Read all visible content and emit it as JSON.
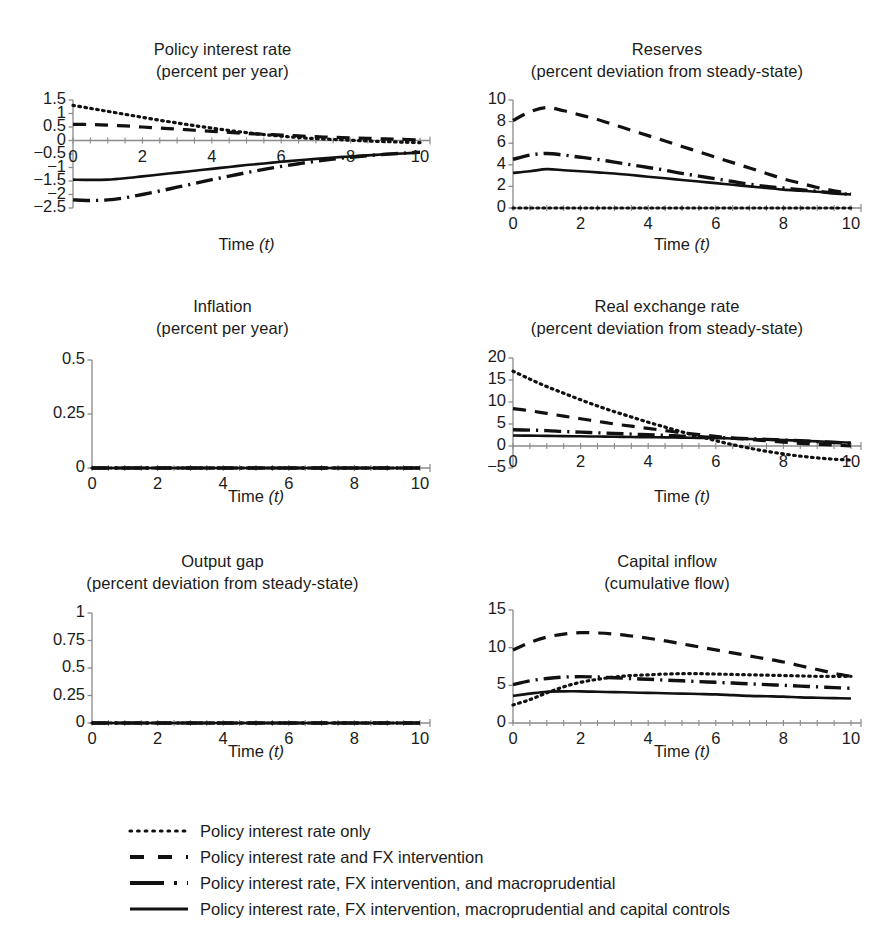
{
  "figure": {
    "axis_label": "Time (t)",
    "axis_label_main": "Time",
    "axis_label_var": "(t)"
  },
  "legend": {
    "position": "bottom",
    "items": [
      {
        "label": "Policy interest rate only",
        "style": "dotted",
        "name": "legend-item-dotted"
      },
      {
        "label": "Policy interest rate and FX intervention",
        "style": "dashed",
        "name": "legend-item-dashed"
      },
      {
        "label": "Policy interest rate, FX intervention, and macroprudential",
        "style": "dash-dot",
        "name": "legend-item-dashdot"
      },
      {
        "label": "Policy interest rate, FX intervention, macroprudential and capital controls",
        "style": "solid",
        "name": "legend-item-solid"
      }
    ]
  },
  "chart_data": [
    {
      "id": "policy-interest-rate",
      "type": "line",
      "title": "Policy interest rate",
      "subtitle": "(percent per year)",
      "xlabel": "Time (t)",
      "ylabel": "",
      "xlim": [
        0,
        10
      ],
      "ylim": [
        -2.5,
        1.5
      ],
      "xticks": [
        0,
        2,
        4,
        6,
        8,
        10
      ],
      "yticks": [
        1.5,
        1,
        0.5,
        0,
        -0.5,
        -1,
        -1.5,
        -2,
        -2.5
      ],
      "ytick_labels": [
        "1.5",
        "1",
        "0.5",
        "0",
        "−0.5",
        "−1",
        "−1.5",
        "−2",
        "−2.5"
      ],
      "grid": false,
      "x": [
        0,
        0.5,
        1,
        1.5,
        2,
        2.5,
        3,
        3.5,
        4,
        4.5,
        5,
        5.5,
        6,
        6.5,
        7,
        7.5,
        8,
        8.5,
        9,
        9.5,
        10
      ],
      "series": [
        {
          "name": "Policy interest rate only",
          "style": "dotted",
          "values": [
            1.3,
            1.19,
            1.08,
            0.97,
            0.86,
            0.75,
            0.65,
            0.55,
            0.46,
            0.37,
            0.29,
            0.22,
            0.16,
            0.11,
            0.07,
            0.04,
            0.01,
            -0.02,
            -0.04,
            -0.06,
            -0.08
          ]
        },
        {
          "name": "Policy interest rate and FX intervention",
          "style": "dashed",
          "values": [
            0.6,
            0.59,
            0.57,
            0.54,
            0.5,
            0.46,
            0.42,
            0.38,
            0.34,
            0.3,
            0.26,
            0.23,
            0.2,
            0.17,
            0.14,
            0.12,
            0.1,
            0.08,
            0.06,
            0.04,
            0.02
          ]
        },
        {
          "name": "Policy interest rate, FX intervention, and macroprudential",
          "style": "dash-dot",
          "values": [
            -2.2,
            -2.22,
            -2.2,
            -2.12,
            -2.0,
            -1.87,
            -1.73,
            -1.59,
            -1.45,
            -1.32,
            -1.19,
            -1.07,
            -0.96,
            -0.86,
            -0.77,
            -0.69,
            -0.62,
            -0.56,
            -0.51,
            -0.47,
            -0.43
          ]
        },
        {
          "name": "Policy interest rate, FX intervention, macroprudential and capital controls",
          "style": "solid",
          "values": [
            -1.45,
            -1.46,
            -1.45,
            -1.4,
            -1.33,
            -1.26,
            -1.19,
            -1.12,
            -1.05,
            -0.98,
            -0.91,
            -0.85,
            -0.79,
            -0.73,
            -0.68,
            -0.63,
            -0.59,
            -0.55,
            -0.51,
            -0.48,
            -0.45
          ]
        }
      ]
    },
    {
      "id": "reserves",
      "type": "line",
      "title": "Reserves",
      "subtitle": "(percent deviation from steady-state)",
      "xlabel": "Time (t)",
      "ylabel": "",
      "xlim": [
        0,
        10
      ],
      "ylim": [
        0,
        10
      ],
      "xticks": [
        0,
        2,
        4,
        6,
        8,
        10
      ],
      "yticks": [
        0,
        2,
        4,
        6,
        8,
        10
      ],
      "ytick_labels": [
        "0",
        "2",
        "4",
        "6",
        "8",
        "10"
      ],
      "grid": false,
      "x": [
        0,
        0.5,
        1,
        1.5,
        2,
        2.5,
        3,
        3.5,
        4,
        4.5,
        5,
        5.5,
        6,
        6.5,
        7,
        7.5,
        8,
        8.5,
        9,
        9.5,
        10
      ],
      "series": [
        {
          "name": "Policy interest rate only",
          "style": "dotted",
          "values": [
            0,
            0,
            0,
            0,
            0,
            0,
            0,
            0,
            0,
            0,
            0,
            0,
            0,
            0,
            0,
            0,
            0,
            0,
            0,
            0,
            0
          ]
        },
        {
          "name": "Policy interest rate and FX intervention",
          "style": "dashed",
          "values": [
            8.1,
            8.9,
            9.3,
            9.0,
            8.6,
            8.2,
            7.7,
            7.2,
            6.7,
            6.2,
            5.7,
            5.2,
            4.7,
            4.2,
            3.7,
            3.2,
            2.7,
            2.3,
            1.9,
            1.6,
            1.3
          ]
        },
        {
          "name": "Policy interest rate, FX intervention, and macroprudential",
          "style": "dash-dot",
          "values": [
            4.5,
            4.9,
            5.05,
            4.9,
            4.7,
            4.5,
            4.25,
            4.0,
            3.75,
            3.5,
            3.2,
            2.95,
            2.7,
            2.45,
            2.2,
            2.0,
            1.85,
            1.7,
            1.55,
            1.4,
            1.25
          ]
        },
        {
          "name": "Policy interest rate, FX intervention, macroprudential and capital controls",
          "style": "solid",
          "values": [
            3.25,
            3.4,
            3.6,
            3.5,
            3.4,
            3.3,
            3.2,
            3.05,
            2.9,
            2.75,
            2.6,
            2.45,
            2.3,
            2.15,
            2.0,
            1.85,
            1.7,
            1.6,
            1.5,
            1.35,
            1.25
          ]
        }
      ]
    },
    {
      "id": "inflation",
      "type": "line",
      "title": "Inflation",
      "subtitle": "(percent per year)",
      "xlabel": "Time (t)",
      "ylabel": "",
      "xlim": [
        0,
        10
      ],
      "ylim": [
        0,
        0.5
      ],
      "xticks": [
        0,
        2,
        4,
        6,
        8,
        10
      ],
      "yticks": [
        0,
        0.25,
        0.5
      ],
      "ytick_labels": [
        "0",
        "0.25",
        "0.5"
      ],
      "grid": false,
      "x": [
        0,
        0.5,
        1,
        1.5,
        2,
        2.5,
        3,
        3.5,
        4,
        4.5,
        5,
        5.5,
        6,
        6.5,
        7,
        7.5,
        8,
        8.5,
        9,
        9.5,
        10
      ],
      "series": [
        {
          "name": "Policy interest rate only",
          "style": "dotted",
          "values": [
            0,
            0,
            0,
            0,
            0,
            0,
            0,
            0,
            0,
            0,
            0,
            0,
            0,
            0,
            0,
            0,
            0,
            0,
            0,
            0,
            0
          ]
        },
        {
          "name": "Policy interest rate and FX intervention",
          "style": "dashed",
          "values": [
            0,
            0,
            0,
            0,
            0,
            0,
            0,
            0,
            0,
            0,
            0,
            0,
            0,
            0,
            0,
            0,
            0,
            0,
            0,
            0,
            0
          ]
        },
        {
          "name": "Policy interest rate, FX intervention, and macroprudential",
          "style": "dash-dot",
          "values": [
            0,
            0,
            0,
            0,
            0,
            0,
            0,
            0,
            0,
            0,
            0,
            0,
            0,
            0,
            0,
            0,
            0,
            0,
            0,
            0,
            0
          ]
        },
        {
          "name": "Policy interest rate, FX intervention, macroprudential and capital controls",
          "style": "solid",
          "values": [
            0,
            0,
            0,
            0,
            0,
            0,
            0,
            0,
            0,
            0,
            0,
            0,
            0,
            0,
            0,
            0,
            0,
            0,
            0,
            0,
            0
          ]
        }
      ]
    },
    {
      "id": "real-exchange-rate",
      "type": "line",
      "title": "Real exchange rate",
      "subtitle": "(percent deviation from steady-state)",
      "xlabel": "Time (t)",
      "ylabel": "",
      "xlim": [
        0,
        10
      ],
      "ylim": [
        -5,
        20
      ],
      "xticks": [
        0,
        2,
        4,
        6,
        8,
        10
      ],
      "yticks": [
        20,
        15,
        10,
        5,
        0,
        -5
      ],
      "ytick_labels": [
        "20",
        "15",
        "10",
        "5",
        "0",
        "−5"
      ],
      "grid": false,
      "x": [
        0,
        0.5,
        1,
        1.5,
        2,
        2.5,
        3,
        3.5,
        4,
        4.5,
        5,
        5.5,
        6,
        6.5,
        7,
        7.5,
        8,
        8.5,
        9,
        9.5,
        10
      ],
      "series": [
        {
          "name": "Policy interest rate only",
          "style": "dotted",
          "values": [
            17.0,
            15.2,
            13.5,
            12.0,
            10.5,
            9.1,
            7.8,
            6.6,
            5.4,
            4.3,
            3.2,
            2.2,
            1.2,
            0.3,
            -0.5,
            -1.2,
            -1.8,
            -2.3,
            -2.7,
            -3.0,
            -3.2
          ]
        },
        {
          "name": "Policy interest rate and FX intervention",
          "style": "dashed",
          "values": [
            8.5,
            8.0,
            7.4,
            6.8,
            6.2,
            5.6,
            5.0,
            4.5,
            4.0,
            3.5,
            3.0,
            2.6,
            2.2,
            1.8,
            1.5,
            1.2,
            0.9,
            0.6,
            0.4,
            0.2,
            0.0
          ]
        },
        {
          "name": "Policy interest rate, FX intervention, and macroprudential",
          "style": "dash-dot",
          "values": [
            3.7,
            3.6,
            3.5,
            3.3,
            3.15,
            3.0,
            2.85,
            2.7,
            2.55,
            2.4,
            2.25,
            2.1,
            1.95,
            1.8,
            1.65,
            1.5,
            1.35,
            1.2,
            1.0,
            0.8,
            0.6
          ]
        },
        {
          "name": "Policy interest rate, FX intervention, macroprudential and capital controls",
          "style": "solid",
          "values": [
            2.4,
            2.35,
            2.3,
            2.25,
            2.2,
            2.15,
            2.1,
            2.05,
            2.0,
            1.95,
            1.9,
            1.85,
            1.8,
            1.7,
            1.6,
            1.5,
            1.35,
            1.2,
            1.05,
            0.9,
            0.75
          ]
        }
      ]
    },
    {
      "id": "output-gap",
      "type": "line",
      "title": "Output gap",
      "subtitle": "(percent deviation from steady-state)",
      "xlabel": "Time (t)",
      "ylabel": "",
      "xlim": [
        0,
        10
      ],
      "ylim": [
        0,
        1
      ],
      "xticks": [
        0,
        2,
        4,
        6,
        8,
        10
      ],
      "yticks": [
        0,
        0.25,
        0.5,
        0.75,
        1
      ],
      "ytick_labels": [
        "0",
        "0.25",
        "0.5",
        "0.75",
        "1"
      ],
      "grid": false,
      "x": [
        0,
        0.5,
        1,
        1.5,
        2,
        2.5,
        3,
        3.5,
        4,
        4.5,
        5,
        5.5,
        6,
        6.5,
        7,
        7.5,
        8,
        8.5,
        9,
        9.5,
        10
      ],
      "series": [
        {
          "name": "Policy interest rate only",
          "style": "dotted",
          "values": [
            0,
            0,
            0,
            0,
            0,
            0,
            0,
            0,
            0,
            0,
            0,
            0,
            0,
            0,
            0,
            0,
            0,
            0,
            0,
            0,
            0
          ]
        },
        {
          "name": "Policy interest rate and FX intervention",
          "style": "dashed",
          "values": [
            0,
            0,
            0,
            0,
            0,
            0,
            0,
            0,
            0,
            0,
            0,
            0,
            0,
            0,
            0,
            0,
            0,
            0,
            0,
            0,
            0
          ]
        },
        {
          "name": "Policy interest rate, FX intervention, and macroprudential",
          "style": "dash-dot",
          "values": [
            0,
            0,
            0,
            0,
            0,
            0,
            0,
            0,
            0,
            0,
            0,
            0,
            0,
            0,
            0,
            0,
            0,
            0,
            0,
            0,
            0
          ]
        },
        {
          "name": "Policy interest rate, FX intervention, macroprudential and capital controls",
          "style": "solid",
          "values": [
            0,
            0,
            0,
            0,
            0,
            0,
            0,
            0,
            0,
            0,
            0,
            0,
            0,
            0,
            0,
            0,
            0,
            0,
            0,
            0,
            0
          ]
        }
      ]
    },
    {
      "id": "capital-inflow",
      "type": "line",
      "title": "Capital inflow",
      "subtitle": "(cumulative flow)",
      "xlabel": "Time (t)",
      "ylabel": "",
      "xlim": [
        0,
        10
      ],
      "ylim": [
        0,
        15
      ],
      "xticks": [
        0,
        2,
        4,
        6,
        8,
        10
      ],
      "yticks": [
        0,
        5,
        10,
        15
      ],
      "ytick_labels": [
        "0",
        "5",
        "10",
        "15"
      ],
      "grid": false,
      "x": [
        0,
        0.5,
        1,
        1.5,
        2,
        2.5,
        3,
        3.5,
        4,
        4.5,
        5,
        5.5,
        6,
        6.5,
        7,
        7.5,
        8,
        8.5,
        9,
        9.5,
        10
      ],
      "series": [
        {
          "name": "Policy interest rate only",
          "style": "dotted",
          "values": [
            2.4,
            3.1,
            4.0,
            4.8,
            5.4,
            5.8,
            6.1,
            6.3,
            6.4,
            6.5,
            6.55,
            6.55,
            6.5,
            6.45,
            6.4,
            6.35,
            6.3,
            6.25,
            6.2,
            6.2,
            6.2
          ]
        },
        {
          "name": "Policy interest rate and FX intervention",
          "style": "dashed",
          "values": [
            9.7,
            10.7,
            11.4,
            11.8,
            12.0,
            11.95,
            11.8,
            11.55,
            11.25,
            10.9,
            10.5,
            10.1,
            9.7,
            9.3,
            8.9,
            8.5,
            8.1,
            7.6,
            7.1,
            6.6,
            6.2
          ]
        },
        {
          "name": "Policy interest rate, FX intervention, and macroprudential",
          "style": "dash-dot",
          "values": [
            5.1,
            5.6,
            5.9,
            6.1,
            6.15,
            6.1,
            6.0,
            5.9,
            5.8,
            5.7,
            5.6,
            5.5,
            5.4,
            5.3,
            5.2,
            5.1,
            5.0,
            4.9,
            4.8,
            4.7,
            4.6
          ]
        },
        {
          "name": "Policy interest rate, FX intervention, macroprudential and capital controls",
          "style": "solid",
          "values": [
            3.6,
            3.9,
            4.15,
            4.2,
            4.2,
            4.15,
            4.1,
            4.05,
            4.0,
            3.95,
            3.9,
            3.85,
            3.8,
            3.7,
            3.6,
            3.55,
            3.5,
            3.4,
            3.35,
            3.3,
            3.25
          ]
        }
      ]
    }
  ]
}
